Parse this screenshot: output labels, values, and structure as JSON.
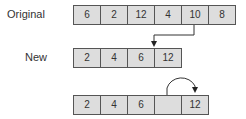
{
  "labels": {
    "original": "Original",
    "new": "New"
  },
  "rows": {
    "original": [
      "6",
      "2",
      "12",
      "4",
      "10",
      "8"
    ],
    "new": [
      "2",
      "4",
      "6",
      "12"
    ],
    "shifted": [
      "2",
      "4",
      "6",
      "",
      "12"
    ]
  }
}
